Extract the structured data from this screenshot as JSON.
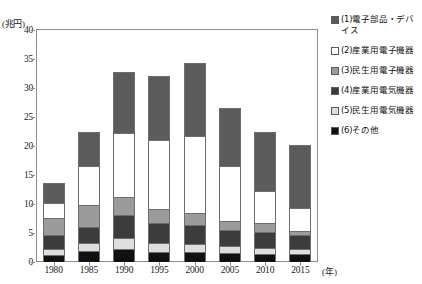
{
  "chart_data": {
    "type": "bar",
    "subtype": "stacked",
    "title": "",
    "xlabel": "(年)",
    "ylabel": "(兆円)",
    "ylim": [
      0,
      40
    ],
    "ytick_step": 5,
    "yticks": [
      0,
      5,
      10,
      15,
      20,
      25,
      30,
      35,
      40
    ],
    "grid": false,
    "legend_position": "right",
    "categories": [
      "1980",
      "1985",
      "1990",
      "1995",
      "2000",
      "2005",
      "2010",
      "2015"
    ],
    "series": [
      {
        "name": "(6)その他",
        "key": "other",
        "color": "#111111",
        "stack_order": 1,
        "values": [
          1.2,
          1.9,
          2.2,
          1.8,
          1.7,
          1.5,
          1.4,
          1.3
        ]
      },
      {
        "name": "(5)民生用電気機器",
        "key": "consumer_electrical",
        "color": "#dedede",
        "stack_order": 2,
        "values": [
          1.0,
          1.4,
          1.9,
          1.5,
          1.4,
          1.2,
          1.1,
          1.0
        ]
      },
      {
        "name": "(4)産業用電気機器",
        "key": "industrial_electrical",
        "color": "#3c3c3c",
        "stack_order": 3,
        "values": [
          2.4,
          2.8,
          4.0,
          3.5,
          3.3,
          2.8,
          2.7,
          2.4
        ]
      },
      {
        "name": "(3)民生用電子機器",
        "key": "consumer_electronic",
        "color": "#9b9b9b",
        "stack_order": 4,
        "values": [
          3.0,
          3.8,
          3.2,
          2.4,
          2.0,
          1.6,
          1.5,
          0.7
        ]
      },
      {
        "name": "(2)産業用電子機器",
        "key": "industrial_electronic",
        "color": "#ffffff",
        "stack_order": 5,
        "values": [
          2.6,
          6.6,
          11.0,
          11.8,
          13.4,
          9.5,
          5.6,
          4.0
        ]
      },
      {
        "name": "(1)電子部品・デバイス",
        "key": "components_devices",
        "color": "#5c5c5c",
        "stack_order": 6,
        "values": [
          3.4,
          6.0,
          10.4,
          11.0,
          12.6,
          9.9,
          10.1,
          10.7
        ]
      }
    ],
    "totals": [
      13.6,
      26.5,
      32.7,
      32.0,
      34.4,
      26.5,
      22.4,
      20.1
    ]
  },
  "legend": {
    "items": [
      {
        "label": "(1)電子部品・デバイス",
        "color": "#5c5c5c"
      },
      {
        "label": "(2)産業用電子機器",
        "color": "#ffffff"
      },
      {
        "label": "(3)民生用電子機器",
        "color": "#9b9b9b"
      },
      {
        "label": "(4)産業用電気機器",
        "color": "#3c3c3c"
      },
      {
        "label": "(5)民生用電気機器",
        "color": "#dedede"
      },
      {
        "label": "(6)その他",
        "color": "#111111"
      }
    ]
  },
  "axes": {
    "y_unit": "(兆円)",
    "x_unit": "(年)",
    "y_labels": [
      "40",
      "35",
      "30",
      "25",
      "20",
      "15",
      "10",
      "5",
      "0"
    ],
    "x_labels": [
      "1980",
      "1985",
      "1990",
      "1995",
      "2000",
      "2005",
      "2010",
      "2015"
    ]
  }
}
